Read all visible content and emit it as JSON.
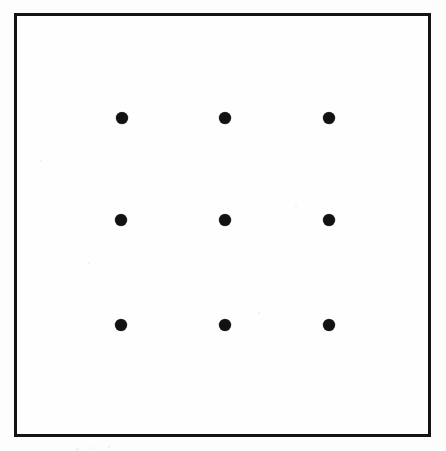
{
  "figure": {
    "name": "nine-dot-puzzle",
    "caption": "",
    "canvas": {
      "width": 446,
      "height": 451
    },
    "colors": {
      "page_background": "#fdfdfd",
      "frame_interior": "#fefefe",
      "frame_stroke": "#141414",
      "dot_fill": "#121212"
    },
    "frame": {
      "name": "outer-square-border",
      "x": 14,
      "y": 13,
      "width": 417,
      "height": 424,
      "stroke_width": 3
    },
    "grid": {
      "rows": 3,
      "columns": 3,
      "dot_count": 9,
      "dot_diameter": 12,
      "column_centers_x": [
        122,
        225,
        329
      ],
      "row_centers_y": [
        118,
        220,
        325
      ],
      "column_spacing": 103,
      "row_spacing": 103
    },
    "dots": [
      {
        "id": "dot-r1c1",
        "label": "top-left",
        "row": 1,
        "col": 1,
        "cx": 122,
        "cy": 118,
        "d": 12
      },
      {
        "id": "dot-r1c2",
        "label": "top-center",
        "row": 1,
        "col": 2,
        "cx": 225,
        "cy": 118,
        "d": 12
      },
      {
        "id": "dot-r1c3",
        "label": "top-right",
        "row": 1,
        "col": 3,
        "cx": 329,
        "cy": 118,
        "d": 12
      },
      {
        "id": "dot-r2c1",
        "label": "middle-left",
        "row": 2,
        "col": 1,
        "cx": 121,
        "cy": 220,
        "d": 12
      },
      {
        "id": "dot-r2c2",
        "label": "middle-center",
        "row": 2,
        "col": 2,
        "cx": 225,
        "cy": 220,
        "d": 12
      },
      {
        "id": "dot-r2c3",
        "label": "middle-right",
        "row": 2,
        "col": 3,
        "cx": 329,
        "cy": 220,
        "d": 12
      },
      {
        "id": "dot-r3c1",
        "label": "bottom-left",
        "row": 3,
        "col": 1,
        "cx": 121,
        "cy": 325,
        "d": 12
      },
      {
        "id": "dot-r3c2",
        "label": "bottom-center",
        "row": 3,
        "col": 2,
        "cx": 225,
        "cy": 325,
        "d": 12
      },
      {
        "id": "dot-r3c3",
        "label": "bottom-right",
        "row": 3,
        "col": 3,
        "cx": 329,
        "cy": 325,
        "d": 12
      }
    ],
    "specks": [
      {
        "x": 40,
        "y": 160,
        "d": 2
      },
      {
        "x": 88,
        "y": 262,
        "d": 2
      },
      {
        "x": 295,
        "y": 205,
        "d": 2
      },
      {
        "x": 258,
        "y": 312,
        "d": 2
      },
      {
        "x": 76,
        "y": 448,
        "d": 3
      },
      {
        "x": 92,
        "y": 447,
        "d": 2
      },
      {
        "x": 108,
        "y": 446,
        "d": 2
      }
    ]
  }
}
